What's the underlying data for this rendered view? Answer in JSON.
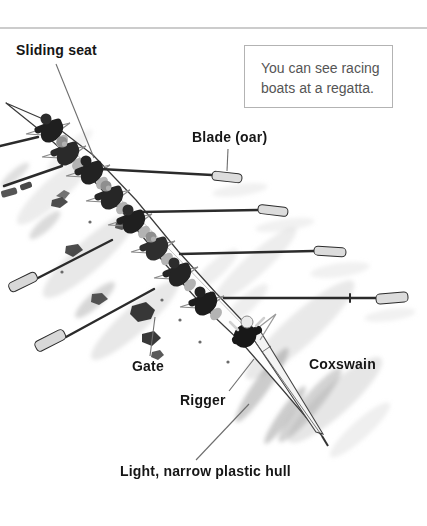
{
  "page": {
    "background_color": "#ffffff",
    "top_rule_color": "#cccccc",
    "label_color": "#161616",
    "leader_line_color": "#6e6e6e"
  },
  "callout": {
    "line1": "You can see racing",
    "line2": "boats at a regatta.",
    "border_color": "#b3b3b3",
    "text_color": "#555555"
  },
  "labels": {
    "sliding_seat": "Sliding seat",
    "blade_oar": "Blade (oar)",
    "gate": "Gate",
    "rigger": "Rigger",
    "coxswain": "Coxswain",
    "hull": "Light, narrow plastic hull"
  },
  "figure": {
    "rowers_count": 8,
    "has_coxswain": true,
    "visible_starboard_blades": 4,
    "visible_port_blades": 2
  }
}
